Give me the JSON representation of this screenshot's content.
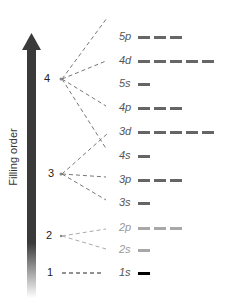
{
  "axis": {
    "label": "Filling order",
    "arrow_color": "#3a3a3a"
  },
  "levels": [
    {
      "n": "4",
      "x": 44,
      "y": 79
    },
    {
      "n": "3",
      "x": 48,
      "y": 174
    },
    {
      "n": "2",
      "x": 46,
      "y": 236
    },
    {
      "n": "1",
      "x": 47,
      "y": 273
    }
  ],
  "orbitals": [
    {
      "label": "5p",
      "y": 37,
      "boxes": 3,
      "color": "#666666",
      "level": "4"
    },
    {
      "label": "4d",
      "y": 61,
      "boxes": 5,
      "color": "#666666",
      "level": "4"
    },
    {
      "label": "5s",
      "y": 84,
      "boxes": 1,
      "color": "#666666",
      "level": "4"
    },
    {
      "label": "4p",
      "y": 108,
      "boxes": 3,
      "color": "#666666",
      "level": "4"
    },
    {
      "label": "3d",
      "y": 132,
      "boxes": 5,
      "color": "#666666",
      "level": "3"
    },
    {
      "label": "4s",
      "y": 156,
      "boxes": 1,
      "color": "#666666",
      "level": "4"
    },
    {
      "label": "3p",
      "y": 180,
      "boxes": 3,
      "color": "#666666",
      "level": "3"
    },
    {
      "label": "3s",
      "y": 203,
      "boxes": 1,
      "color": "#666666",
      "level": "3"
    },
    {
      "label": "2p",
      "y": 228,
      "boxes": 3,
      "color": "#a8a8a8",
      "level": "2"
    },
    {
      "label": "2s",
      "y": 250,
      "boxes": 1,
      "color": "#a8a8a8",
      "level": "2"
    },
    {
      "label": "1s",
      "y": 273,
      "boxes": 1,
      "color": "#000000",
      "level": "1"
    }
  ]
}
